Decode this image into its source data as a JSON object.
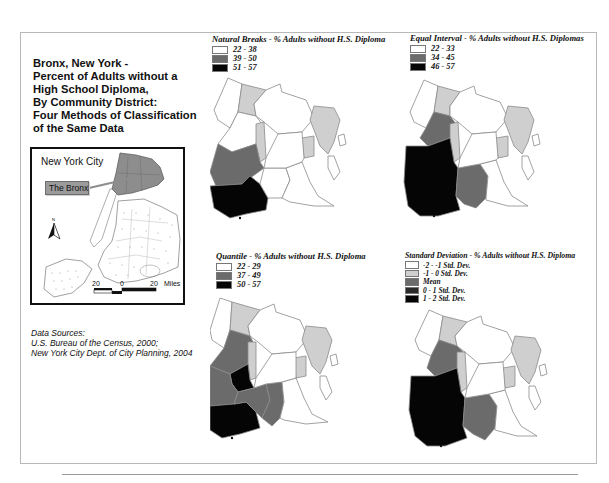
{
  "title": {
    "lines": [
      "Bronx, New York -",
      "Percent of Adults without a",
      "High School Diploma,",
      "By Community District:",
      "Four Methods of Classification",
      "of the Same Data"
    ]
  },
  "inset": {
    "label": "New York City",
    "callout": "The Bronx",
    "north_arrow": "N",
    "scale": {
      "left": "20",
      "center": "0",
      "right": "20",
      "unit": "Miles"
    }
  },
  "sources": {
    "heading": "Data Sources:",
    "lines": [
      "U.S. Bureau of the Census, 2000;",
      "New York City Dept. of City Planning, 2004"
    ]
  },
  "colors": {
    "white": "#ffffff",
    "light": "#cfcfcf",
    "mid": "#6b6b6b",
    "dark": "#2a2a2a",
    "black": "#050505"
  },
  "maps": [
    {
      "id": "natural-breaks",
      "legend_title": "Natural Breaks - % Adults without H.S. Diploma",
      "classes": [
        {
          "label": "22 - 38",
          "color": "#ffffff"
        },
        {
          "label": "39 - 50",
          "color": "#6b6b6b"
        },
        {
          "label": "51 - 57",
          "color": "#050505"
        }
      ]
    },
    {
      "id": "equal-interval",
      "legend_title": "Equal Interval - % Adults without H.S. Diplomas",
      "classes": [
        {
          "label": "22 - 33",
          "color": "#ffffff"
        },
        {
          "label": "34 - 45",
          "color": "#6b6b6b"
        },
        {
          "label": "46 - 57",
          "color": "#050505"
        }
      ]
    },
    {
      "id": "quantile",
      "legend_title": "Quantile - % Adults without H.S. Diploma",
      "classes": [
        {
          "label": "22 - 29",
          "color": "#ffffff"
        },
        {
          "label": "37 - 49",
          "color": "#6b6b6b"
        },
        {
          "label": "50 - 57",
          "color": "#050505"
        }
      ]
    },
    {
      "id": "standard-deviation",
      "legend_title": "Standard Deviation - % Adults without H.S. Diploma",
      "classes": [
        {
          "label": "-2 - -1 Std. Dev.",
          "color": "#ffffff"
        },
        {
          "label": "-1 - 0 Std. Dev.",
          "color": "#cfcfcf"
        },
        {
          "label": "Mean",
          "color": "#6b6b6b"
        },
        {
          "label": "0 - 1 Std. Dev.",
          "color": "#2a2a2a"
        },
        {
          "label": "1 - 2 Std. Dev.",
          "color": "#050505"
        }
      ]
    }
  ]
}
